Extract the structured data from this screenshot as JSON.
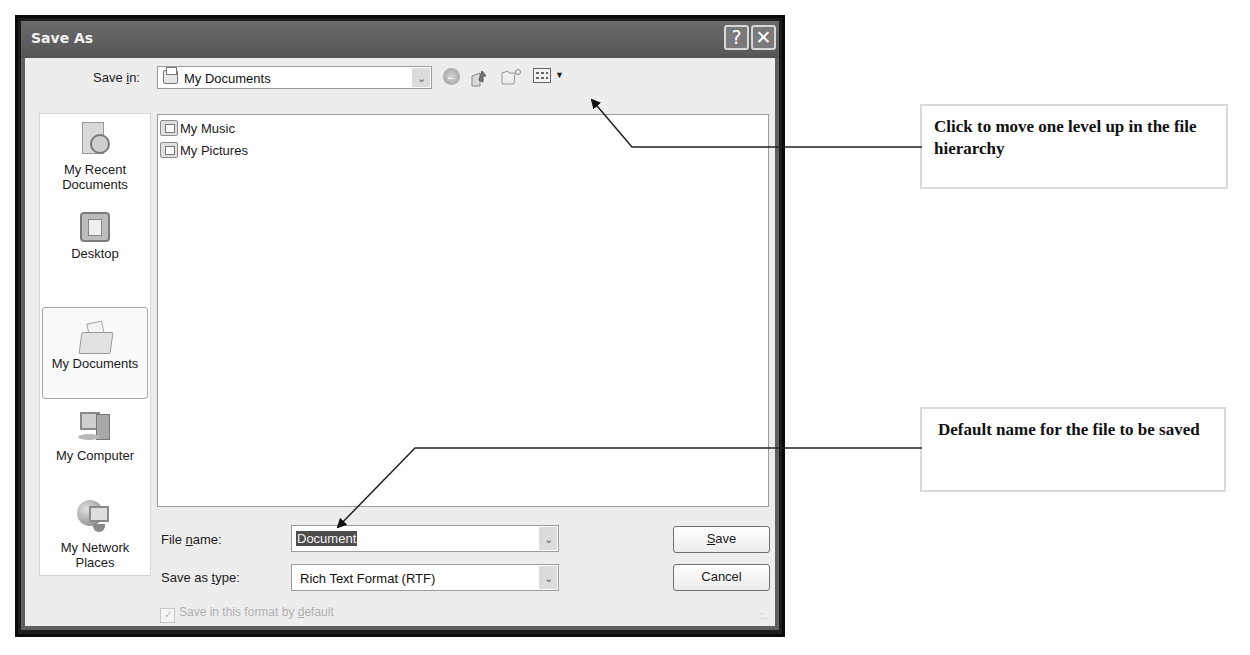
{
  "dialog": {
    "title": "Save As",
    "help_button": "?",
    "close_button": "✕",
    "save_in": {
      "label_pre": "Save ",
      "label_u": "i",
      "label_post": "n:",
      "value": "My Documents"
    },
    "toolbar": {
      "back": "back-icon",
      "up": "up-one-level-icon",
      "new_folder": "new-folder-icon",
      "views": "views-menu-icon"
    },
    "places": [
      {
        "label_line1": "My Recent",
        "label_line2": "Documents",
        "icon": "recent-documents-icon"
      },
      {
        "label_line1": "Desktop",
        "label_line2": "",
        "icon": "desktop-icon"
      },
      {
        "label_line1": "My Documents",
        "label_line2": "",
        "icon": "my-documents-icon",
        "selected": true
      },
      {
        "label_line1": "My Computer",
        "label_line2": "",
        "icon": "my-computer-icon"
      },
      {
        "label_line1": "My Network",
        "label_line2": "Places",
        "icon": "network-places-icon"
      }
    ],
    "files": [
      {
        "name": "My Music"
      },
      {
        "name": "My Pictures"
      }
    ],
    "file_name": {
      "label_pre": "File ",
      "label_u": "n",
      "label_post": "ame:",
      "value": "Document"
    },
    "save_as_type": {
      "label_pre": "Save as ",
      "label_u": "t",
      "label_post": "ype:",
      "value": "Rich Text Format (RTF)"
    },
    "save_button": {
      "u": "S",
      "rest": "ave"
    },
    "cancel_button": "Cancel",
    "default_format_checkbox": {
      "label_pre": "Save in this format by ",
      "label_u": "d",
      "label_post": "efault",
      "checked": true
    }
  },
  "callouts": {
    "up_level": "Click to move one level up in the file hierarchy",
    "default_name": "Default name for the file to be saved"
  }
}
